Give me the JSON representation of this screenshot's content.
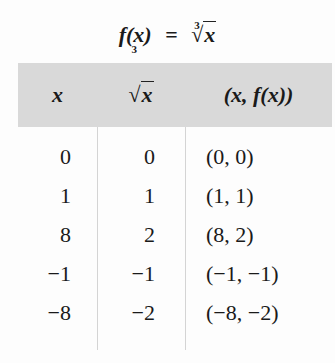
{
  "title": {
    "lhs": "f(x)",
    "equals": "=",
    "rhs_index": "3",
    "rhs_radical": "√",
    "rhs_radicand": "x"
  },
  "table": {
    "headers": [
      {
        "label": "x"
      },
      {
        "index": "3",
        "radical": "√",
        "radicand": "x"
      },
      {
        "label": "(x, f(x))"
      }
    ],
    "rows": [
      {
        "x": "0",
        "cbrt": "0",
        "pair": "(0, 0)"
      },
      {
        "x": "1",
        "cbrt": "1",
        "pair": "(1, 1)"
      },
      {
        "x": "8",
        "cbrt": "2",
        "pair": "(8, 2)"
      },
      {
        "x": "−1",
        "cbrt": "−1",
        "pair": "(−1, −1)"
      },
      {
        "x": "−8",
        "cbrt": "−2",
        "pair": "(−8, −2)"
      }
    ]
  },
  "colors": {
    "header_bg": "#d9d9d9",
    "divider": "#d4d4d4",
    "text": "#1a1a1a"
  }
}
